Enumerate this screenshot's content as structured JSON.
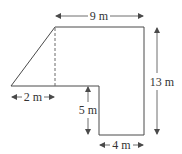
{
  "figure": {
    "colors": {
      "stroke": "#4a4a4a",
      "text": "#333333",
      "background": "#ffffff"
    }
  },
  "dimensions": {
    "top_width": {
      "value": 9,
      "unit": "m",
      "label": "9 m"
    },
    "right_height": {
      "value": 13,
      "unit": "m",
      "label": "13 m"
    },
    "triangle_base": {
      "value": 2,
      "unit": "m",
      "label": "2 m"
    },
    "step_height": {
      "value": 5,
      "unit": "m",
      "label": "5 m"
    },
    "bottom_width": {
      "value": 4,
      "unit": "m",
      "label": "4 m"
    }
  }
}
